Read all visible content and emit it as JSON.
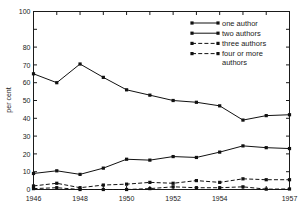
{
  "chart_data": {
    "type": "line",
    "title": "",
    "xlabel": "",
    "ylabel": "per cent",
    "xlim": [
      1946,
      1957
    ],
    "ylim": [
      0,
      100
    ],
    "grid": false,
    "legend_position": "top-right",
    "x": [
      1946,
      1947,
      1948,
      1949,
      1950,
      1951,
      1952,
      1953,
      1954,
      1955,
      1956,
      1957
    ],
    "xticks": [
      1946,
      1947,
      1948,
      1949,
      1950,
      1951,
      1952,
      1953,
      1954,
      1955,
      1956,
      1957
    ],
    "xtick_labels": [
      "1946",
      "",
      "1948",
      "",
      "1950",
      "",
      "1952",
      "",
      "1954",
      "",
      "",
      "1957"
    ],
    "yticks": [
      0,
      10,
      20,
      30,
      40,
      50,
      60,
      70,
      80,
      90,
      100
    ],
    "ytick_labels": [
      "0",
      "10",
      "20",
      "30",
      "40",
      "50",
      "60",
      "70",
      "80",
      "",
      "100"
    ],
    "series": [
      {
        "name": "one author",
        "style": "solid",
        "values": [
          65,
          60,
          70.5,
          63,
          56,
          53,
          50,
          49,
          47,
          39,
          41.5,
          42
        ]
      },
      {
        "name": "two authors",
        "style": "solid",
        "values": [
          9,
          10.5,
          8.5,
          12,
          17,
          16.5,
          18.5,
          18,
          21,
          24.5,
          23.5,
          23
        ]
      },
      {
        "name": "three authors",
        "style": "dashed",
        "values": [
          2,
          3.5,
          1,
          2.5,
          3,
          4,
          3.5,
          5,
          4,
          6,
          5.5,
          5.5
        ]
      },
      {
        "name": "four or more authors",
        "style": "dashed",
        "values": [
          0.5,
          1,
          0,
          0,
          0,
          0.5,
          1.5,
          1,
          1,
          1.5,
          0.2,
          0.3
        ]
      }
    ]
  },
  "legend": {
    "entries": [
      {
        "label": "one author"
      },
      {
        "label": "two authors"
      },
      {
        "label": "three authors"
      },
      {
        "label": "four or more"
      },
      {
        "label": "authors"
      }
    ]
  }
}
